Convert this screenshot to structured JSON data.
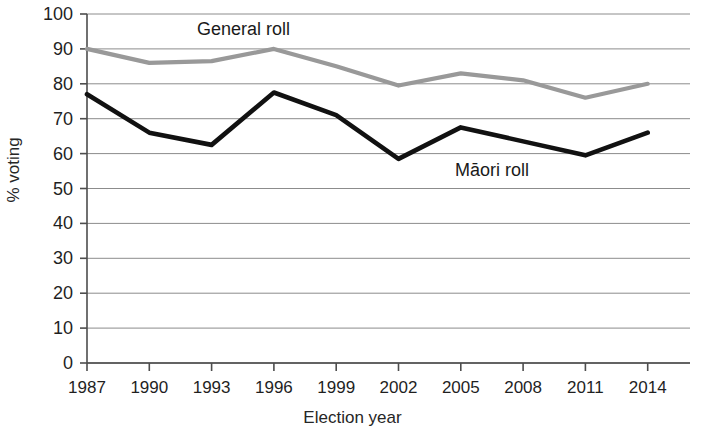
{
  "chart_data": {
    "type": "line",
    "title": "",
    "xlabel": "Election year",
    "ylabel": "% voting",
    "categories": [
      "1987",
      "1990",
      "1993",
      "1996",
      "1999",
      "2002",
      "2005",
      "2008",
      "2011",
      "2014"
    ],
    "x": [
      1987,
      1990,
      1993,
      1996,
      1999,
      2002,
      2005,
      2008,
      2011,
      2014
    ],
    "ylim": [
      0,
      100
    ],
    "ytick_step": 10,
    "yticks": [
      "100",
      "90",
      "80",
      "70",
      "60",
      "50",
      "40",
      "30",
      "20",
      "10",
      "0"
    ],
    "grid": "horizontal",
    "legend_position": "inline-annotation",
    "series": [
      {
        "name": "General roll",
        "color": "#999999",
        "values": [
          90,
          86,
          86.5,
          90,
          85,
          79.5,
          83,
          81,
          76,
          80
        ]
      },
      {
        "name": "Māori roll",
        "color": "#111111",
        "values": [
          77,
          66,
          62.5,
          77.5,
          71,
          58.5,
          67.5,
          63.5,
          59.5,
          66
        ]
      }
    ],
    "annotations": [
      {
        "text": "General roll",
        "series": "General roll"
      },
      {
        "text": "Māori roll",
        "series": "Māori roll"
      }
    ],
    "axis_color": "#4d4d4d",
    "gridline_color": "#8c8c8c"
  }
}
